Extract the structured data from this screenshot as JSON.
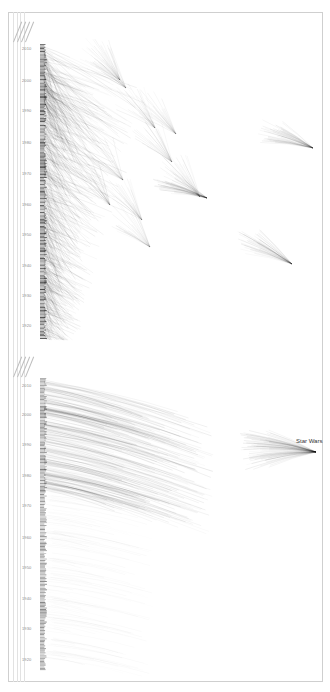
{
  "chart_data": [
    {
      "type": "line",
      "title": "",
      "description": "Reference network: each film (by release year) draws curved lines to the older films it references; fans converge on highly-referenced films",
      "xlabel": "",
      "ylabel": "Year",
      "ylim": [
        1915,
        2013
      ],
      "y_ticks": [
        "2010",
        "2000",
        "1990",
        "1980",
        "1970",
        "1960",
        "1950",
        "1940",
        "1930",
        "1920"
      ],
      "column_headers": [
        "",
        "",
        "",
        ""
      ],
      "grid": false,
      "hubs": [
        {
          "x": 313,
          "y": 148,
          "year_origin_approx": 1980
        },
        {
          "x": 292,
          "y": 264,
          "year_origin_approx": 1940
        },
        {
          "x": 207,
          "y": 198,
          "year_origin_approx": 1960
        }
      ]
    },
    {
      "type": "line",
      "title": "",
      "description": "Reference network filtered: lines from later films converging on a single highly-referenced film",
      "xlabel": "",
      "ylabel": "Year",
      "ylim": [
        1915,
        2013
      ],
      "y_ticks": [
        "2010",
        "2000",
        "1990",
        "1980",
        "1970",
        "1960",
        "1950",
        "1940",
        "1930",
        "1920"
      ],
      "column_headers": [
        "",
        "",
        "",
        ""
      ],
      "grid": false,
      "annotations": [
        {
          "text": "Star Wars",
          "year": 1977
        }
      ]
    }
  ],
  "panels": {
    "top": {
      "ticks": [
        {
          "label": "2010",
          "y": 48
        },
        {
          "label": "2000",
          "y": 80
        },
        {
          "label": "1990",
          "y": 110
        },
        {
          "label": "1980",
          "y": 142
        },
        {
          "label": "1970",
          "y": 173
        },
        {
          "label": "1960",
          "y": 204
        },
        {
          "label": "1950",
          "y": 234
        },
        {
          "label": "1940",
          "y": 265
        },
        {
          "label": "1930",
          "y": 295
        },
        {
          "label": "1920",
          "y": 325
        }
      ]
    },
    "bottom": {
      "ticks": [
        {
          "label": "2010",
          "y": 385
        },
        {
          "label": "2000",
          "y": 414
        },
        {
          "label": "1990",
          "y": 444
        },
        {
          "label": "1980",
          "y": 475
        },
        {
          "label": "1970",
          "y": 505
        },
        {
          "label": "1960",
          "y": 537
        },
        {
          "label": "1950",
          "y": 567
        },
        {
          "label": "1940",
          "y": 598
        },
        {
          "label": "1930",
          "y": 628
        },
        {
          "label": "1920",
          "y": 659
        }
      ],
      "annotation": "Star Wars"
    }
  }
}
